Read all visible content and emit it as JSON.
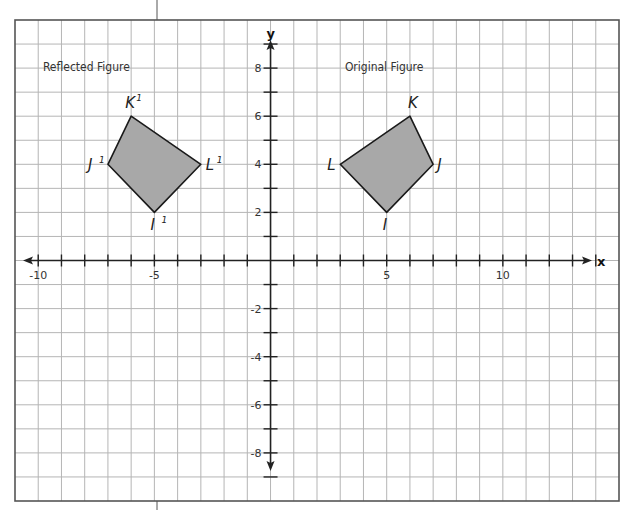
{
  "chart_data": {
    "type": "scatter",
    "title": "",
    "xlabel": "x",
    "ylabel": "y",
    "xlim": [
      -11,
      15
    ],
    "ylim": [
      -10,
      10
    ],
    "grid": true,
    "x_tick_labels": [
      {
        "value": -10,
        "label": "-10"
      },
      {
        "value": -5,
        "label": "-5"
      },
      {
        "value": 5,
        "label": "5"
      },
      {
        "value": 10,
        "label": "10"
      }
    ],
    "y_tick_labels": [
      {
        "value": 8,
        "label": "8"
      },
      {
        "value": 6,
        "label": "6"
      },
      {
        "value": 4,
        "label": "4"
      },
      {
        "value": 2,
        "label": "2"
      },
      {
        "value": -2,
        "label": "-2"
      },
      {
        "value": -4,
        "label": "-4"
      },
      {
        "value": -6,
        "label": "-6"
      },
      {
        "value": -8,
        "label": "-8"
      }
    ],
    "x_ticks": [
      -10,
      -9,
      -8,
      -7,
      -6,
      -5,
      -4,
      -3,
      -2,
      -1,
      1,
      2,
      3,
      4,
      5,
      6,
      7,
      8,
      9,
      10,
      11,
      12,
      13,
      14
    ],
    "y_ticks": [
      -9,
      -8,
      -7,
      -6,
      -5,
      -4,
      -3,
      -2,
      -1,
      1,
      2,
      3,
      4,
      5,
      6,
      7,
      8,
      9
    ],
    "series": [
      {
        "name": "Original Figure",
        "title_position": {
          "x": 3.2,
          "y": 7.9
        },
        "points": [
          {
            "label": "I",
            "x": 5,
            "y": 2
          },
          {
            "label": "J",
            "x": 7,
            "y": 4
          },
          {
            "label": "K",
            "x": 6,
            "y": 6
          },
          {
            "label": "L",
            "x": 3,
            "y": 4
          }
        ]
      },
      {
        "name": "Reflected Figure",
        "title_position": {
          "x": -9.8,
          "y": 7.9
        },
        "points": [
          {
            "label": "I",
            "prime": "1",
            "x": -5,
            "y": 2
          },
          {
            "label": "J",
            "prime": "1",
            "x": -7,
            "y": 4
          },
          {
            "label": "K",
            "prime": "1",
            "x": -6,
            "y": 6
          },
          {
            "label": "L",
            "prime": "1",
            "x": -3,
            "y": 4
          }
        ]
      }
    ]
  },
  "labels": {
    "original_title": "Original Figure",
    "reflected_title": "Reflected Figure",
    "x_axis": "x",
    "y_axis": "y"
  },
  "colors": {
    "fill": "#a8a8a8",
    "outline": "#1a1a1a",
    "grid": "#b5b5b5",
    "border": "#555555",
    "axis": "#222222"
  }
}
